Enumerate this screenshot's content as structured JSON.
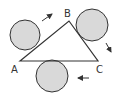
{
  "diagram": {
    "type": "triangle-with-rolling-circles",
    "vertices": [
      {
        "label": "A",
        "x": 20,
        "y": 61
      },
      {
        "label": "B",
        "x": 69,
        "y": 21
      },
      {
        "label": "C",
        "x": 98,
        "y": 61
      }
    ],
    "circles": [
      {
        "id": "circle-ab",
        "cx": 25,
        "cy": 35,
        "r": 15,
        "arrow": "up-right"
      },
      {
        "id": "circle-bc",
        "cx": 92,
        "cy": 25,
        "r": 16,
        "arrow": "down-right"
      },
      {
        "id": "circle-ca",
        "cx": 52,
        "cy": 76,
        "r": 16,
        "arrow": "left"
      }
    ],
    "colors": {
      "stroke": "#333333",
      "circle_fill": "#d9d9d9",
      "background": "#ffffff"
    }
  },
  "labels": {
    "a": "A",
    "b": "B",
    "c": "C"
  }
}
